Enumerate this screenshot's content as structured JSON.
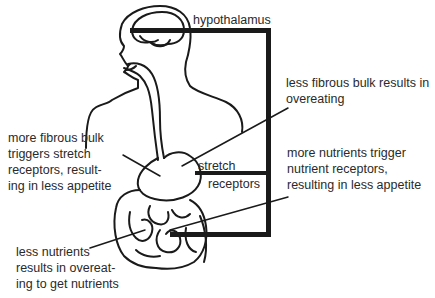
{
  "diagram": {
    "labels": {
      "hypothalamus": "hypothalamus",
      "less_fibrous": "less fibrous bulk results in\novereating",
      "more_fibrous": "more fibrous bulk\ntriggers stretch\nreceptors, result-\ning in less appetite",
      "stretch": "stretch",
      "receptors": "receptors",
      "more_nutrients": "more nutrients trigger\nnutrient receptors,\nresulting in less appetite",
      "less_nutrients": "less nutrients\nresults in overeat-\ning to get nutrients"
    },
    "colors": {
      "ink": "#1a1a1a",
      "text": "#2a2a2a",
      "background": "#ffffff"
    }
  }
}
